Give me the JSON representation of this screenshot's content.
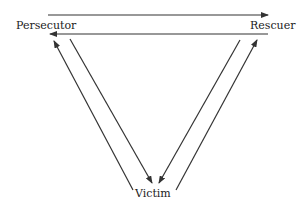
{
  "diagram": {
    "nodes": {
      "persecutor": "Persecutor",
      "rescuer": "Rescuer",
      "victim": "Victim"
    },
    "edges": [
      {
        "from": "Persecutor",
        "to": "Rescuer"
      },
      {
        "from": "Rescuer",
        "to": "Persecutor"
      },
      {
        "from": "Victim",
        "to": "Persecutor"
      },
      {
        "from": "Persecutor",
        "to": "Victim"
      },
      {
        "from": "Rescuer",
        "to": "Victim"
      },
      {
        "from": "Victim",
        "to": "Rescuer"
      }
    ],
    "colors": {
      "line": "#333333",
      "text": "#222222"
    }
  }
}
